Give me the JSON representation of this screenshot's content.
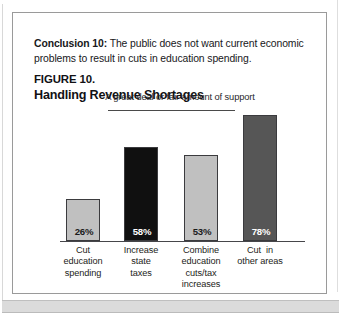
{
  "conclusion": {
    "lead": "Conclusion  10:",
    "body": " The public does not want current economic problems to result in cuts in education spending."
  },
  "figure": {
    "label": "FIGURE 10.",
    "title": "Handling Revenue Shortages"
  },
  "chart_data": {
    "type": "bar",
    "title": "Handling Revenue Shortages",
    "subtitle": "A great deal or fair amount of support",
    "xlabel": "",
    "ylabel": "",
    "ylim": [
      0,
      100
    ],
    "grid": false,
    "legend": "none",
    "categories": [
      "Cut education spending",
      "Increase state taxes",
      "Combine education cuts/tax increases",
      "Cut in other areas"
    ],
    "category_lines": [
      [
        "Cut",
        "education",
        "spending"
      ],
      [
        "Increase",
        "state",
        "taxes"
      ],
      [
        "Combine",
        "education",
        "cuts/tax",
        "increases"
      ],
      [
        "Cut  in",
        "other areas"
      ]
    ],
    "values": [
      26,
      58,
      53,
      78
    ],
    "value_labels": [
      "26%",
      "58%",
      "53%",
      "78%"
    ],
    "bar_colors": [
      "#c0c0c0",
      "#101010",
      "#c0c0c0",
      "#565656"
    ],
    "value_label_colors": [
      "#1a1a1a",
      "#ffffff",
      "#1a1a1a",
      "#ffffff"
    ]
  }
}
